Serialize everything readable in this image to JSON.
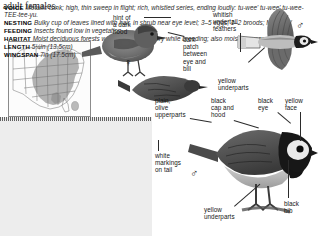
{
  "page": {
    "carryover_text": "adult females.",
    "species_implied": "Hooded Warbler"
  },
  "map": {
    "name": "range-map",
    "region_shading": "eastern United States breeding range",
    "shade_color": "#9a9a9a",
    "outline_color": "#6e6e6e"
  },
  "info_panel": {
    "entries": [
      {
        "label": "VOICE",
        "text": "Metallic tsink; high, thin sweep in flight; rich, whistled series, ending loudly: tu-wee' tu-wee' tu-wee-TEE-tee-yu."
      },
      {
        "label": "NESTING",
        "text": "Bulky cup of leaves lined with hair, in shrub near eye level; 3–5 eggs; 1–2 broods; May–Jul."
      },
      {
        "label": "FEEDING",
        "text": "Insects found low in vegetation."
      },
      {
        "label": "HABITAT",
        "text": "Moist deciduous forests with dense understory while breeding; also moist canyons."
      },
      {
        "label": "LENGTH",
        "text": "5¼in (13.5cm)"
      },
      {
        "label": "WINGSPAN",
        "text": "7in (17.5cm)"
      }
    ]
  },
  "callouts": {
    "hint_hood": "hint of\na dark\nhood",
    "dark_patch": "dark\npatch\nbetween\neye and\nbill",
    "whitish_undertail": "whitish\nundertail\nfeathers",
    "yellow_underparts_top": "yellow\nunderparts",
    "plain_olive": "plain,\nolive\nupperparts",
    "black_cap_hood": "black\ncap and\nhood",
    "black_eye": "black\neye",
    "yellow_face": "yellow\nface",
    "white_markings": "white\nmarkings\non tail",
    "black_bib": "black\nbib",
    "yellow_underparts_bottom": "yellow\nunderparts"
  },
  "symbols": {
    "female": "♀",
    "male_flight": "♂",
    "male_perched": "♂"
  },
  "colors": {
    "panel_bg": "#ededed",
    "text": "#141414",
    "leader": "#2b2b2b",
    "bird_dark": "#3b3b3b",
    "bird_mid": "#7a7a7a",
    "bird_light": "#c9c9c9"
  }
}
